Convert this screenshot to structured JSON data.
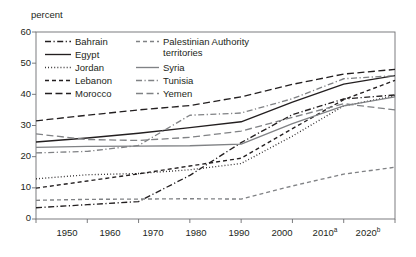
{
  "chart_data": {
    "type": "line",
    "title": "",
    "ylabel": "percent",
    "xlabel": "",
    "ylim": [
      0,
      60
    ],
    "yticks": [
      0,
      10,
      20,
      30,
      40,
      50,
      60
    ],
    "xticks": [
      "1950",
      "1960",
      "1970",
      "1980",
      "1990",
      "2000",
      "2010",
      "2020"
    ],
    "xtick_notes": {
      "2010": "a",
      "2020": "b"
    },
    "x": [
      1950,
      1960,
      1970,
      1980,
      1990,
      2000,
      2010,
      2020
    ],
    "grid": false,
    "legend_position": "inside-top-left",
    "series": [
      {
        "name": "Bahrain",
        "style": "dash-dot",
        "color": "#231f20",
        "values": [
          3.6,
          4.6,
          5.6,
          14.0,
          24.5,
          33.5,
          38.5,
          39.8
        ]
      },
      {
        "name": "Egypt",
        "style": "solid",
        "color": "#231f20",
        "values": [
          24.7,
          26.0,
          27.5,
          29.3,
          31.2,
          37.5,
          43.3,
          46.0
        ]
      },
      {
        "name": "Jordan",
        "style": "dotted",
        "color": "#231f20",
        "values": [
          12.9,
          14.2,
          14.6,
          15.8,
          17.8,
          26.6,
          36.3,
          39.5
        ]
      },
      {
        "name": "Lebanon",
        "style": "dashed",
        "color": "#231f20",
        "values": [
          9.9,
          12.2,
          14.5,
          17.0,
          19.5,
          29.0,
          38.3,
          44.5
        ]
      },
      {
        "name": "Morocco",
        "style": "long-dash",
        "color": "#231f20",
        "values": [
          31.5,
          33.3,
          35.0,
          36.4,
          39.2,
          43.2,
          46.5,
          48.0
        ]
      },
      {
        "name": "Palestinian Authority territories",
        "style": "dashed",
        "color": "#808285",
        "values": [
          6.0,
          6.3,
          6.4,
          6.5,
          6.4,
          10.6,
          14.4,
          16.6
        ]
      },
      {
        "name": "Syria",
        "style": "solid",
        "color": "#808285",
        "values": [
          23.0,
          23.3,
          23.4,
          23.5,
          24.0,
          30.6,
          36.3,
          39.2
        ]
      },
      {
        "name": "Tunisia",
        "style": "dash-dot",
        "color": "#808285",
        "values": [
          21.2,
          21.7,
          23.6,
          33.3,
          34.0,
          38.6,
          45.0,
          46.0
        ]
      },
      {
        "name": "Yemen",
        "style": "long-dash",
        "color": "#808285",
        "values": [
          27.3,
          25.5,
          25.2,
          26.2,
          28.2,
          32.6,
          37.0,
          35.0
        ]
      }
    ]
  },
  "legend": {
    "column1": [
      {
        "label": "Bahrain"
      },
      {
        "label": "Egypt"
      },
      {
        "label": "Jordan"
      },
      {
        "label": "Lebanon"
      },
      {
        "label": "Morocco"
      }
    ],
    "column2": [
      {
        "label": "Palestinian Authority"
      },
      {
        "label": "territories"
      },
      {
        "label": "Syria"
      },
      {
        "label": "Tunisia"
      },
      {
        "label": "Yemen"
      }
    ]
  },
  "axes": {
    "ylabel": "percent",
    "y": [
      "60",
      "50",
      "40",
      "30",
      "20",
      "10",
      "0"
    ],
    "x": [
      "1950",
      "1960",
      "1970",
      "1980",
      "1990",
      "2000",
      "2010",
      "2020"
    ],
    "x_sup": [
      "",
      "",
      "",
      "",
      "",
      "",
      "a",
      "b"
    ]
  },
  "colors": {
    "black": "#231f20",
    "gray": "#808285",
    "axis": "#6d6e71"
  }
}
